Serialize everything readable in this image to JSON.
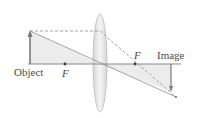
{
  "diagram": {
    "type": "converging-lens-ray-diagram",
    "labels": {
      "object": "Object",
      "image": "Image",
      "focal_left": "F",
      "focal_right": "F"
    },
    "geometry": {
      "axis": {
        "x1": 28,
        "x2": 181,
        "y": 64
      },
      "lens": {
        "cx": 100,
        "cy": 63,
        "rx": 7,
        "ry": 49
      },
      "object_arrow": {
        "x": 30,
        "y_base": 64,
        "y_tip": 31
      },
      "image_arrow": {
        "x": 171,
        "y_base": 64,
        "y_tip": 92
      },
      "focal_left": {
        "x": 65,
        "y": 64
      },
      "focal_right": {
        "x": 135,
        "y": 64
      },
      "convergence_point": {
        "x": 176,
        "y": 97
      }
    },
    "colors": {
      "line": "#8a8a8a",
      "arrow": "#7a7a7a",
      "shade": "#ececec",
      "lens_fill": "#e4e4e4",
      "lens_edge": "#bdbdbd",
      "text": "#4a4a4a"
    }
  }
}
